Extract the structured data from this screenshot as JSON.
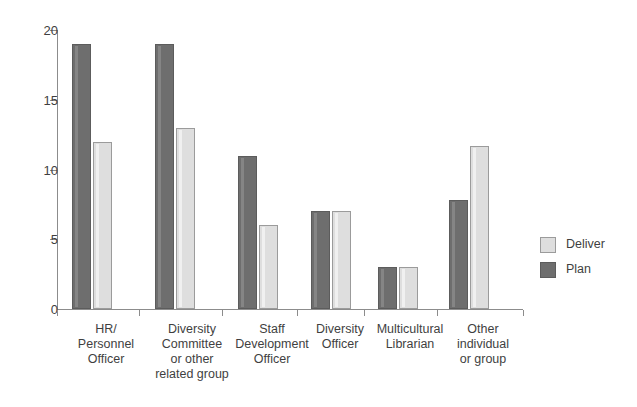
{
  "chart_data": {
    "type": "bar",
    "title": "",
    "subtitle": "",
    "xlabel": "",
    "ylabel": "",
    "ylim": [
      0,
      20
    ],
    "yticks": [
      0,
      5,
      10,
      15,
      20
    ],
    "ytick_labels": [
      "0",
      "5",
      "10",
      "15",
      "20"
    ],
    "grid": false,
    "legend_position": "right",
    "categories": [
      "HR/ Personnel Officer",
      "Diversity Committee or other related group",
      "Staff Development Officer",
      "Diversity Officer",
      "Multicultural Librarian",
      "Other individual or group"
    ],
    "category_lines": [
      [
        "HR/",
        "Personnel",
        "Officer"
      ],
      [
        "Diversity",
        "Committee",
        "or other",
        "related group"
      ],
      [
        "Staff",
        "Development",
        "Officer"
      ],
      [
        "Diversity",
        "Officer"
      ],
      [
        "Multicultural",
        "Librarian"
      ],
      [
        "Other",
        "individual",
        "or group"
      ]
    ],
    "series": [
      {
        "name": "Plan",
        "color": "#6e6e6e",
        "values": [
          19,
          19,
          11,
          7,
          3,
          7.8
        ]
      },
      {
        "name": "Deliver",
        "color": "#dedede",
        "values": [
          12,
          13,
          6,
          7,
          3,
          11.7
        ]
      }
    ]
  },
  "legend": {
    "items": [
      {
        "label": "Deliver",
        "swatch": "deliver"
      },
      {
        "label": "Plan",
        "swatch": "plan"
      }
    ]
  },
  "colors": {
    "plan": "#6e6e6e",
    "deliver": "#dedede",
    "axis": "#8c8c8c",
    "text": "#3f3f3f",
    "background": "#ffffff"
  }
}
